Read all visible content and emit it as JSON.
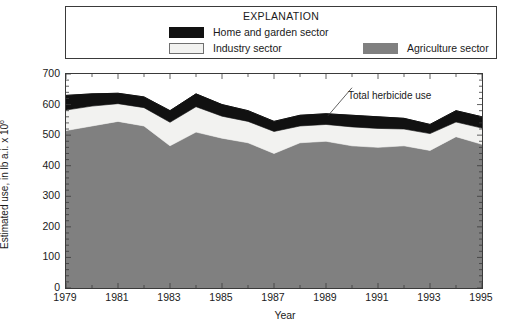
{
  "chart_data": {
    "type": "area",
    "title": "",
    "xlabel": "Year",
    "ylabel": "Estimated use, in lb a.i. x 10",
    "ylabel_exponent": "6",
    "xlim": [
      1979,
      1995
    ],
    "ylim": [
      0,
      700
    ],
    "y_ticks": [
      0,
      100,
      200,
      300,
      400,
      500,
      600,
      700
    ],
    "x_ticks": [
      1979,
      1981,
      1983,
      1985,
      1987,
      1989,
      1991,
      1993,
      1995
    ],
    "x_tick_labels": [
      "1979",
      "1981",
      "1983",
      "1985",
      "1987",
      "1989",
      "1991",
      "1993",
      "1995"
    ],
    "y_tick_labels": [
      "0",
      "100",
      "200",
      "300",
      "400",
      "500",
      "600",
      "700"
    ],
    "grid": false,
    "stacked": true,
    "legend_position": "top",
    "x": [
      1979,
      1980,
      1981,
      1982,
      1983,
      1984,
      1985,
      1986,
      1987,
      1988,
      1989,
      1990,
      1991,
      1992,
      1993,
      1994,
      1995
    ],
    "series": [
      {
        "name": "Agriculture sector",
        "color": "#808080",
        "values": [
          515,
          530,
          545,
          530,
          465,
          510,
          490,
          475,
          440,
          475,
          480,
          465,
          460,
          465,
          450,
          495,
          470
        ]
      },
      {
        "name": "Industry sector",
        "color": "#f2f2f0",
        "values": [
          67,
          65,
          58,
          60,
          77,
          83,
          72,
          70,
          72,
          55,
          55,
          62,
          62,
          55,
          55,
          48,
          53
        ]
      },
      {
        "name": "Home and garden sector",
        "color": "#111111",
        "values": [
          48,
          40,
          34,
          35,
          38,
          42,
          38,
          35,
          33,
          35,
          35,
          38,
          38,
          35,
          30,
          37,
          37
        ]
      }
    ],
    "totals": [
      630,
      635,
      637,
      625,
      580,
      635,
      600,
      580,
      545,
      565,
      570,
      565,
      560,
      555,
      535,
      580,
      560
    ],
    "annotations": [
      {
        "text": "Total herbicide use",
        "points_to_year": 1989,
        "points_to_value": 570
      }
    ]
  },
  "legend": {
    "title": "EXPLANATION",
    "items": [
      {
        "label": "Home and garden sector",
        "swatch": "black"
      },
      {
        "label": "Industry sector",
        "swatch": "light"
      },
      {
        "label": "Agriculture sector",
        "swatch": "gray"
      }
    ]
  },
  "colors": {
    "agriculture": "#808080",
    "industry": "#f2f2f0",
    "home_and_garden": "#111111",
    "axis": "#3a3a3a",
    "background": "#ffffff"
  }
}
